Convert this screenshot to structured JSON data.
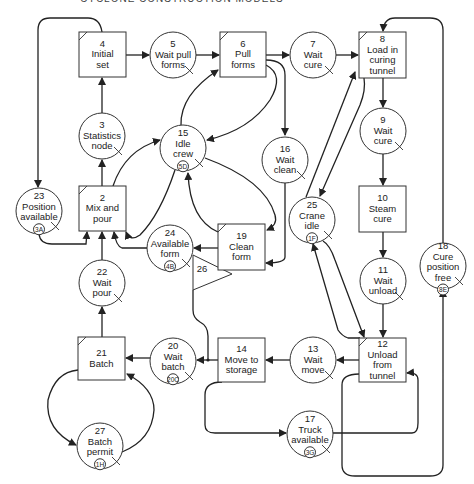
{
  "header": {
    "text": "CYCLONE CONSTRUCTION MODELS"
  },
  "nodes": [
    {
      "id": "4",
      "type": "combi",
      "lines": [
        "4",
        "Initial",
        "set"
      ],
      "x": 79,
      "y": 32,
      "w": 47,
      "h": 45
    },
    {
      "id": "5",
      "type": "queue",
      "lines": [
        "5",
        "Wait pull",
        "forms"
      ],
      "cx": 173,
      "cy": 55
    },
    {
      "id": "6",
      "type": "combi",
      "lines": [
        "6",
        "Pull",
        "forms"
      ],
      "x": 220,
      "y": 32,
      "w": 46,
      "h": 45
    },
    {
      "id": "7",
      "type": "queue",
      "lines": [
        "7",
        "Wait",
        "cure"
      ],
      "cx": 313,
      "cy": 55
    },
    {
      "id": "8",
      "type": "combi",
      "lines": [
        "8",
        "Load in",
        "curing",
        "tunnel"
      ],
      "x": 359,
      "y": 32,
      "w": 47,
      "h": 46
    },
    {
      "id": "9",
      "type": "queue",
      "lines": [
        "9",
        "Wait",
        "cure"
      ],
      "cx": 383,
      "cy": 131
    },
    {
      "id": "10",
      "type": "normal",
      "lines": [
        "10",
        "Steam",
        "cure"
      ],
      "x": 359,
      "y": 186,
      "w": 47,
      "h": 46
    },
    {
      "id": "11",
      "type": "queue",
      "lines": [
        "11",
        "Wait",
        "unload"
      ],
      "cx": 383,
      "cy": 281
    },
    {
      "id": "12",
      "type": "combi",
      "lines": [
        "12",
        "Unload",
        "from",
        "tunnel"
      ],
      "x": 359,
      "y": 338,
      "w": 47,
      "h": 44
    },
    {
      "id": "13",
      "type": "queue",
      "lines": [
        "13",
        "Wait",
        "move"
      ],
      "cx": 313,
      "cy": 360
    },
    {
      "id": "14",
      "type": "normal",
      "lines": [
        "14",
        "Move to",
        "storage"
      ],
      "x": 218,
      "y": 338,
      "w": 47,
      "h": 44
    },
    {
      "id": "15",
      "type": "queue",
      "lines": [
        "15",
        "Idle",
        "crew"
      ],
      "resource": "5D",
      "cx": 183,
      "cy": 148
    },
    {
      "id": "16",
      "type": "queue",
      "lines": [
        "16",
        "Wait",
        "clean"
      ],
      "cx": 285,
      "cy": 160
    },
    {
      "id": "17",
      "type": "queue",
      "lines": [
        "17",
        "Truck",
        "available"
      ],
      "resource": "3G",
      "cx": 310,
      "cy": 434
    },
    {
      "id": "18",
      "type": "queue",
      "lines": [
        "18",
        "Cure",
        "position",
        "free"
      ],
      "resource": "8E",
      "cx": 443,
      "cy": 266
    },
    {
      "id": "19",
      "type": "combi",
      "lines": [
        "19",
        "Clean",
        "form"
      ],
      "x": 218,
      "y": 224,
      "w": 47,
      "h": 46
    },
    {
      "id": "20",
      "type": "queue",
      "lines": [
        "20",
        "Wait",
        "batch"
      ],
      "resource": "20C",
      "cx": 173,
      "cy": 361
    },
    {
      "id": "21",
      "type": "combi",
      "lines": [
        "21",
        "Batch"
      ],
      "x": 78,
      "y": 337,
      "w": 47,
      "h": 43
    },
    {
      "id": "22",
      "type": "queue",
      "lines": [
        "22",
        "Wait",
        "pour"
      ],
      "cx": 102,
      "cy": 283
    },
    {
      "id": "23",
      "type": "queue",
      "lines": [
        "23",
        "Position",
        "available"
      ],
      "resource": "3A",
      "cx": 39,
      "cy": 211
    },
    {
      "id": "24",
      "type": "queue",
      "lines": [
        "24",
        "Available",
        "form"
      ],
      "resource": "4B",
      "cx": 170,
      "cy": 248
    },
    {
      "id": "25",
      "type": "queue",
      "lines": [
        "25",
        "Crane",
        "idle"
      ],
      "resource": "1F",
      "cx": 312,
      "cy": 220
    },
    {
      "id": "27",
      "type": "queue",
      "lines": [
        "27",
        "Batch",
        "permit"
      ],
      "resource": "1H",
      "cx": 100,
      "cy": 446
    },
    {
      "id": "2",
      "type": "combi",
      "lines": [
        "2",
        "Mix and",
        "pour"
      ],
      "x": 79,
      "y": 186,
      "w": 47,
      "h": 45
    },
    {
      "id": "3",
      "type": "queue",
      "lines": [
        "3",
        "Statistics",
        "node"
      ],
      "cx": 102,
      "cy": 136
    }
  ],
  "counter": {
    "id": "26",
    "label": "26"
  },
  "colors": {
    "line": "#222222",
    "background": "#ffffff"
  }
}
